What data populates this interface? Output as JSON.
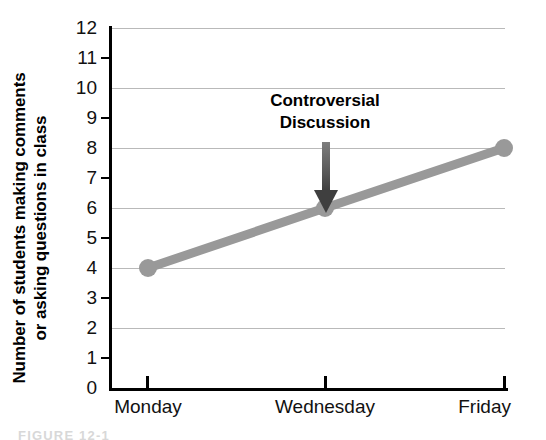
{
  "chart_data": {
    "type": "line",
    "title": "",
    "xlabel": "",
    "ylabel_line1": "Number of students making comments",
    "ylabel_line2": "or asking questions in class",
    "categories": [
      "Monday",
      "Wednesday",
      "Friday"
    ],
    "values": [
      4,
      6,
      8
    ],
    "series": [
      {
        "name": "Students making comments or asking questions in class",
        "values": [
          4,
          6,
          8
        ],
        "color": "#999999",
        "marker": "circle"
      }
    ],
    "ylim": [
      0,
      12
    ],
    "ytick_labels": [
      "0",
      "1",
      "2",
      "3",
      "4",
      "5",
      "6",
      "7",
      "8",
      "9",
      "10",
      "11",
      "12"
    ],
    "ytick_values": [
      0,
      1,
      2,
      3,
      4,
      5,
      6,
      7,
      8,
      9,
      10,
      11,
      12
    ],
    "gridline_values": [
      2,
      4,
      6,
      8,
      10,
      12
    ],
    "minor_tick_values": [
      1,
      3,
      5,
      7,
      9,
      11
    ],
    "grid": true,
    "legend": "none",
    "annotations": [
      {
        "text_line1": "Controversial",
        "text_line2": "Discussion",
        "points_to_x": "Wednesday",
        "points_to_y": 6,
        "arrow": "down-arrow"
      }
    ]
  },
  "caption": {
    "text": "FIGURE 12-1"
  },
  "colors": {
    "series": "#999999",
    "grid": "#b9b9b9",
    "axis": "#000000",
    "text": "#111111",
    "annotation": "#000000",
    "caption": "#d8d8d8"
  }
}
